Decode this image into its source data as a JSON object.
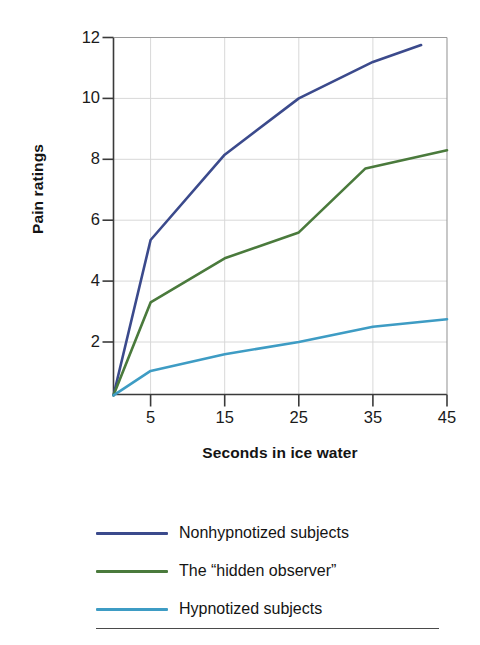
{
  "chart_data": {
    "type": "line",
    "title": "",
    "xlabel": "Seconds in ice water",
    "ylabel": "Pain ratings",
    "xlim": [
      0,
      45
    ],
    "ylim": [
      0,
      12
    ],
    "xticks": [
      5,
      15,
      25,
      35,
      45
    ],
    "yticks": [
      2,
      4,
      6,
      8,
      10,
      12
    ],
    "xtick_labels": [
      "5",
      "15",
      "25",
      "35",
      "45"
    ],
    "ytick_labels": [
      "2",
      "4",
      "6",
      "8",
      "10",
      "12"
    ],
    "grid": "horizontal-and-vertical-light",
    "legend_position": "below-plot",
    "series": [
      {
        "name": "Nonhypnotized subjects",
        "color": "#3b4a8c",
        "x": [
          0,
          5,
          15,
          25,
          35,
          41.5
        ],
        "values": [
          0.25,
          5.35,
          8.15,
          10.0,
          11.2,
          11.75
        ]
      },
      {
        "name": "The “hidden observer”",
        "color": "#4a7a3c",
        "x": [
          0,
          5,
          15,
          25,
          34,
          45
        ],
        "values": [
          0.25,
          3.3,
          4.75,
          5.6,
          7.7,
          8.3
        ]
      },
      {
        "name": "Hypnotized subjects",
        "color": "#3e9cc4",
        "x": [
          0,
          5,
          15,
          25,
          35,
          45
        ],
        "values": [
          0.25,
          1.05,
          1.6,
          2.0,
          2.5,
          2.75
        ]
      }
    ]
  },
  "axes": {
    "y_title": "Pain ratings",
    "x_title": "Seconds in ice water"
  },
  "legend": {
    "items": [
      {
        "label": "Nonhypnotized subjects",
        "color": "#3b4a8c"
      },
      {
        "label": "The “hidden observer”",
        "color": "#4a7a3c"
      },
      {
        "label": "Hypnotized subjects",
        "color": "#3e9cc4"
      }
    ]
  },
  "colors": {
    "axis": "#3a3a3a",
    "grid": "#d8d8d8",
    "text": "#1a1a1a",
    "background": "#ffffff"
  }
}
